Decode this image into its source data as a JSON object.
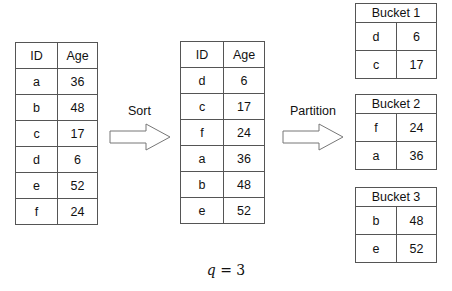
{
  "original_table": {
    "headers": [
      "ID",
      "Age"
    ],
    "rows": [
      {
        "id": "a",
        "age": "36"
      },
      {
        "id": "b",
        "age": "48"
      },
      {
        "id": "c",
        "age": "17"
      },
      {
        "id": "d",
        "age": "6"
      },
      {
        "id": "e",
        "age": "52"
      },
      {
        "id": "f",
        "age": "24"
      }
    ]
  },
  "sort_arrow": {
    "label": "Sort"
  },
  "sorted_table": {
    "headers": [
      "ID",
      "Age"
    ],
    "rows": [
      {
        "id": "d",
        "age": "6"
      },
      {
        "id": "c",
        "age": "17"
      },
      {
        "id": "f",
        "age": "24"
      },
      {
        "id": "a",
        "age": "36"
      },
      {
        "id": "b",
        "age": "48"
      },
      {
        "id": "e",
        "age": "52"
      }
    ]
  },
  "partition_arrow": {
    "label": "Partition"
  },
  "buckets": [
    {
      "title": "Bucket 1",
      "rows": [
        {
          "id": "d",
          "age": "6"
        },
        {
          "id": "c",
          "age": "17"
        }
      ]
    },
    {
      "title": "Bucket 2",
      "rows": [
        {
          "id": "f",
          "age": "24"
        },
        {
          "id": "a",
          "age": "36"
        }
      ]
    },
    {
      "title": "Bucket 3",
      "rows": [
        {
          "id": "b",
          "age": "48"
        },
        {
          "id": "e",
          "age": "52"
        }
      ]
    }
  ],
  "caption": {
    "var": "q",
    "op": " = ",
    "value": "3"
  }
}
